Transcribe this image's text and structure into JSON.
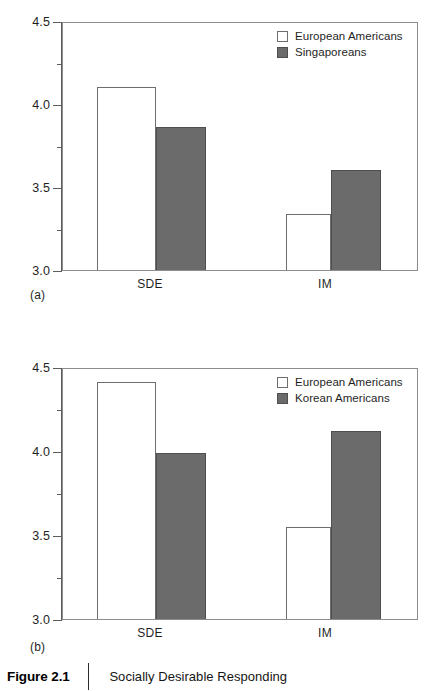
{
  "figure": {
    "number": "Figure 2.1",
    "title": "Socially Desirable Responding"
  },
  "colors": {
    "filled_bar": "#6b6b6b",
    "open_bar": "#ffffff",
    "bar_outline": "#5d5d5d",
    "axis": "#5d5d5d",
    "frame": "#8c8c8c",
    "text": "#1f1f1f"
  },
  "panels": [
    {
      "tag": "(a)",
      "legend": [
        {
          "label": "European Americans",
          "style": "open"
        },
        {
          "label": "Singaporeans",
          "style": "filled"
        }
      ],
      "y_labels": [
        "4.5",
        "4.0",
        "3.5",
        "3.0"
      ],
      "x_labels": [
        "SDE",
        "IM"
      ]
    },
    {
      "tag": "(b)",
      "legend": [
        {
          "label": "European Americans",
          "style": "open"
        },
        {
          "label": "Korean Americans",
          "style": "filled"
        }
      ],
      "y_labels": [
        "4.5",
        "4.0",
        "3.5",
        "3.0"
      ],
      "x_labels": [
        "SDE",
        "IM"
      ]
    }
  ],
  "chart_data": [
    {
      "type": "bar",
      "title": "Socially Desirable Responding",
      "panel": "(a)",
      "xlabel": "",
      "ylabel": "",
      "ylim": [
        3.0,
        4.5
      ],
      "yticks": [
        3.0,
        3.5,
        4.0,
        4.5
      ],
      "yticks_minor": [
        3.25,
        3.75,
        4.25
      ],
      "ytick_labels": [
        "3.0",
        "3.5",
        "4.0",
        "4.5"
      ],
      "grid": false,
      "legend_position": "top-right",
      "categories": [
        "SDE",
        "IM"
      ],
      "series": [
        {
          "name": "European Americans",
          "values": [
            4.1,
            3.34
          ],
          "style": "open"
        },
        {
          "name": "Singaporeans",
          "values": [
            3.86,
            3.6
          ],
          "style": "filled"
        }
      ]
    },
    {
      "type": "bar",
      "title": "Socially Desirable Responding",
      "panel": "(b)",
      "xlabel": "",
      "ylabel": "",
      "ylim": [
        3.0,
        4.5
      ],
      "yticks": [
        3.0,
        3.5,
        4.0,
        4.5
      ],
      "yticks_minor": [
        3.25,
        3.75,
        4.25
      ],
      "ytick_labels": [
        "3.0",
        "3.5",
        "4.0",
        "4.5"
      ],
      "grid": false,
      "legend_position": "top-right",
      "categories": [
        "SDE",
        "IM"
      ],
      "series": [
        {
          "name": "European Americans",
          "values": [
            4.41,
            3.55
          ],
          "style": "open"
        },
        {
          "name": "Korean Americans",
          "values": [
            3.99,
            4.12
          ],
          "style": "filled"
        }
      ]
    }
  ]
}
